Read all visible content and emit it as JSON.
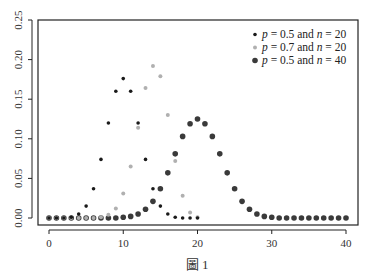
{
  "chart_data": {
    "type": "scatter",
    "title": "",
    "caption": "圖 1",
    "xlabel": "",
    "ylabel": "",
    "xlim": [
      0,
      40
    ],
    "ylim": [
      0,
      0.25
    ],
    "x_ticks": [
      0,
      10,
      20,
      30,
      40
    ],
    "y_ticks": [
      "0.00",
      "0.05",
      "0.10",
      "0.15",
      "0.20",
      "0.25"
    ],
    "grid": false,
    "legend_position": "top-right",
    "series": [
      {
        "name": "p = 0.5 and n = 20",
        "legend_parts": [
          "p",
          " = 0.5 and ",
          "n",
          " = 20"
        ],
        "color": "#1a1a1a",
        "marker_size": 1.8,
        "x": [
          0,
          1,
          2,
          3,
          4,
          5,
          6,
          7,
          8,
          9,
          10,
          11,
          12,
          13,
          14,
          15,
          16,
          17,
          18,
          19,
          20
        ],
        "values": [
          0.0,
          0.0,
          0.0,
          0.001,
          0.005,
          0.015,
          0.037,
          0.074,
          0.12,
          0.16,
          0.176,
          0.16,
          0.12,
          0.074,
          0.037,
          0.015,
          0.005,
          0.001,
          0.0,
          0.0,
          0.0
        ]
      },
      {
        "name": "p = 0.7 and n = 20",
        "legend_parts": [
          "p",
          " = 0.7 and ",
          "n",
          " = 20"
        ],
        "color": "#b0b0b0",
        "marker_size": 2.0,
        "x": [
          0,
          1,
          2,
          3,
          4,
          5,
          6,
          7,
          8,
          9,
          10,
          11,
          12,
          13,
          14,
          15,
          16,
          17,
          18,
          19,
          20
        ],
        "values": [
          0.0,
          0.0,
          0.0,
          0.0,
          0.0,
          0.0,
          0.0,
          0.001,
          0.004,
          0.012,
          0.031,
          0.065,
          0.114,
          0.164,
          0.192,
          0.179,
          0.13,
          0.072,
          0.028,
          0.007,
          0.001
        ]
      },
      {
        "name": "p = 0.5 and n = 40",
        "legend_parts": [
          "p",
          " = 0.5 and ",
          "n",
          " = 40"
        ],
        "color": "#3a3a3a",
        "marker_size": 2.8,
        "x": [
          0,
          1,
          2,
          3,
          4,
          5,
          6,
          7,
          8,
          9,
          10,
          11,
          12,
          13,
          14,
          15,
          16,
          17,
          18,
          19,
          20,
          21,
          22,
          23,
          24,
          25,
          26,
          27,
          28,
          29,
          30,
          31,
          32,
          33,
          34,
          35,
          36,
          37,
          38,
          39,
          40
        ],
        "values": [
          0.0,
          0.0,
          0.0,
          0.0,
          0.0,
          0.0,
          0.0,
          0.0,
          0.0,
          0.0,
          0.001,
          0.002,
          0.005,
          0.011,
          0.021,
          0.037,
          0.057,
          0.081,
          0.103,
          0.119,
          0.125,
          0.119,
          0.103,
          0.081,
          0.057,
          0.037,
          0.021,
          0.011,
          0.005,
          0.002,
          0.001,
          0.0,
          0.0,
          0.0,
          0.0,
          0.0,
          0.0,
          0.0,
          0.0,
          0.0,
          0.0
        ]
      }
    ]
  }
}
